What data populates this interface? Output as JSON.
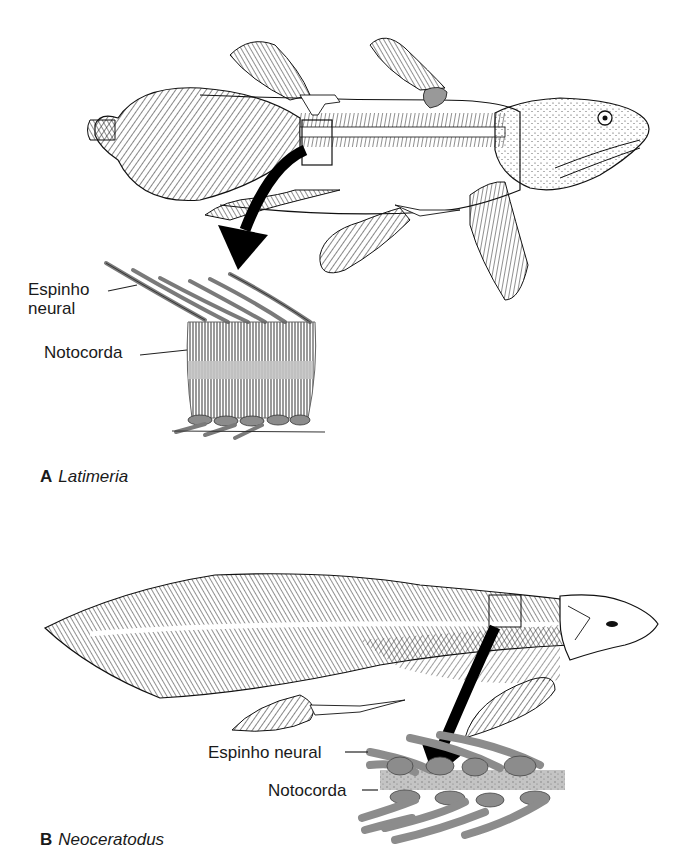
{
  "panel_a": {
    "letter": "A",
    "genus": "Latimeria",
    "labels": {
      "neural_spine_line1": "Espinho",
      "neural_spine_line2": "neural",
      "notochord": "Notocorda"
    }
  },
  "panel_b": {
    "letter": "B",
    "genus": "Neoceratodus",
    "labels": {
      "neural_spine": "Espinho neural",
      "notochord": "Notocorda"
    }
  },
  "colors": {
    "ink": "#1a1a1a",
    "bone_gray": "#8c8c8c",
    "notochord_gray": "#c4c4c4",
    "arrow": "#000000"
  }
}
